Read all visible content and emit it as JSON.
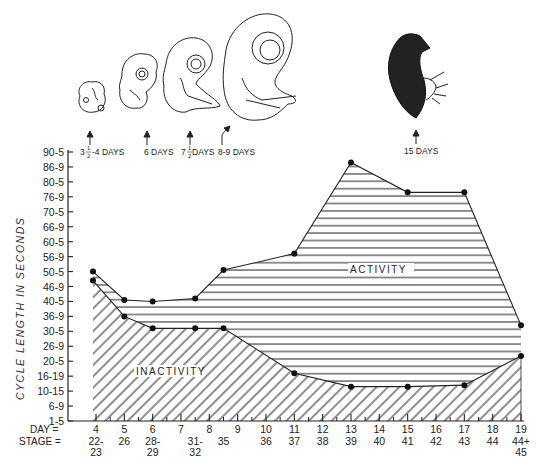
{
  "chart_data": {
    "type": "area",
    "title": "",
    "ylabel": "CYCLE LENGTH IN SECONDS",
    "xlabel_rows": [
      {
        "label": "DAY =",
        "ticks": [
          "4",
          "5",
          "6",
          "7",
          "8",
          "9",
          "10",
          "11",
          "12",
          "13",
          "14",
          "15",
          "16",
          "17",
          "18",
          "19"
        ]
      },
      {
        "label": "STAGE =",
        "ticks": [
          "22-\n23",
          "26",
          "28-\n29",
          "31-\n32",
          "35",
          "",
          "36",
          "37",
          "38",
          "39",
          "40",
          "41",
          "42",
          "43",
          "44",
          "44+\n45"
        ]
      }
    ],
    "stage_labels": [
      {
        "day": 4,
        "text": [
          "22-",
          "23"
        ]
      },
      {
        "day": 5,
        "text": [
          "26"
        ]
      },
      {
        "day": 6,
        "text": [
          "28-",
          "29"
        ]
      },
      {
        "day": 7.5,
        "text": [
          "31-",
          "32"
        ]
      },
      {
        "day": 8.5,
        "text": [
          "35"
        ]
      },
      {
        "day": 10,
        "text": [
          "36"
        ]
      },
      {
        "day": 11,
        "text": [
          "37"
        ]
      },
      {
        "day": 12,
        "text": [
          "38"
        ]
      },
      {
        "day": 13,
        "text": [
          "39"
        ]
      },
      {
        "day": 14,
        "text": [
          "40"
        ]
      },
      {
        "day": 15,
        "text": [
          "41"
        ]
      },
      {
        "day": 16,
        "text": [
          "42"
        ]
      },
      {
        "day": 17,
        "text": [
          "43"
        ]
      },
      {
        "day": 18,
        "text": [
          "44"
        ]
      },
      {
        "day": 19,
        "text": [
          "44+",
          "45"
        ]
      }
    ],
    "y_ticks": [
      "1-5",
      "6-9",
      "10-15",
      "16-19",
      "20-5",
      "26-9",
      "30-5",
      "36-9",
      "40-5",
      "46-9",
      "50-5",
      "56-9",
      "60-5",
      "66-9",
      "70-5",
      "76-9",
      "80-5",
      "86-9",
      "90-5"
    ],
    "x_day_range": [
      4,
      19
    ],
    "series": [
      {
        "name": "Activity (upper boundary = total cycle length)",
        "pattern": "horizontal-hatch",
        "points_day_tickindex": [
          [
            4,
            10.0
          ],
          [
            5,
            8.1
          ],
          [
            6,
            8.0
          ],
          [
            7.5,
            8.2
          ],
          [
            8.5,
            10.1
          ],
          [
            11,
            11.2
          ],
          [
            13,
            17.3
          ],
          [
            15,
            15.3
          ],
          [
            17,
            15.3
          ],
          [
            19,
            6.4
          ]
        ]
      },
      {
        "name": "Inactivity (upper boundary)",
        "pattern": "diagonal-hatch",
        "points_day_tickindex": [
          [
            4,
            9.4
          ],
          [
            5,
            7.0
          ],
          [
            6,
            6.2
          ],
          [
            7.5,
            6.2
          ],
          [
            8.5,
            6.2
          ],
          [
            11,
            3.2
          ],
          [
            13,
            2.3
          ],
          [
            15,
            2.3
          ],
          [
            17,
            2.4
          ],
          [
            19,
            4.35
          ]
        ]
      }
    ],
    "area_labels": [
      "ACTIVITY",
      "INACTIVITY"
    ],
    "illustrations": [
      {
        "label_parts": [
          "3",
          "1",
          "2",
          "-4 DAYS"
        ],
        "label": "3½-4 DAYS",
        "kind": "embryo"
      },
      {
        "label": "6 DAYS",
        "kind": "embryo"
      },
      {
        "label_parts": [
          "7",
          "1",
          "2",
          " DAYS"
        ],
        "label": "7½ DAYS",
        "kind": "embryo"
      },
      {
        "label": "8-9 DAYS",
        "kind": "embryo"
      },
      {
        "label": "15 DAYS",
        "kind": "chick"
      }
    ],
    "grid": false,
    "legend": "none"
  },
  "labels": {
    "ylabel": "CYCLE LENGTH IN SECONDS",
    "day_prefix": "DAY =",
    "stage_prefix": "STAGE =",
    "activity": "ACTIVITY",
    "inactivity": "INACTIVITY",
    "illus_1_whole": "3",
    "illus_1_num": "1",
    "illus_1_den": "2",
    "illus_1_rest": "-4 DAYS",
    "illus_2": "6 DAYS",
    "illus_3_whole": "7",
    "illus_3_num": "1",
    "illus_3_den": "2",
    "illus_3_rest": " DAYS",
    "illus_4": "8-9 DAYS",
    "illus_5": "15 DAYS"
  },
  "colors": {
    "ink": "#1a1a1a",
    "background": "#ffffff"
  }
}
